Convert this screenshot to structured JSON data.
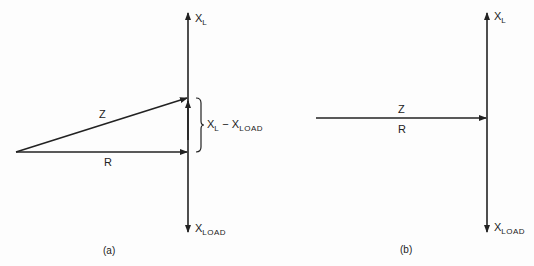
{
  "diagram_a": {
    "caption": "(a)",
    "top_axis": {
      "main": "X",
      "sub": "L"
    },
    "bottom_axis": {
      "main": "X",
      "sub": "LOAD"
    },
    "hypotenuse_label": "Z",
    "resistance_label": "R",
    "brace_label": {
      "a_main": "X",
      "a_sub": "L",
      "op": "−",
      "b_main": "X",
      "b_sub": "LOAD"
    }
  },
  "diagram_b": {
    "caption": "(b)",
    "top_axis": {
      "main": "X",
      "sub": "L"
    },
    "bottom_axis": {
      "main": "X",
      "sub": "LOAD"
    },
    "impedance_label": "Z",
    "resistance_label": "R"
  },
  "colors": {
    "ink": "#222222",
    "background": "#fdfdfd"
  }
}
